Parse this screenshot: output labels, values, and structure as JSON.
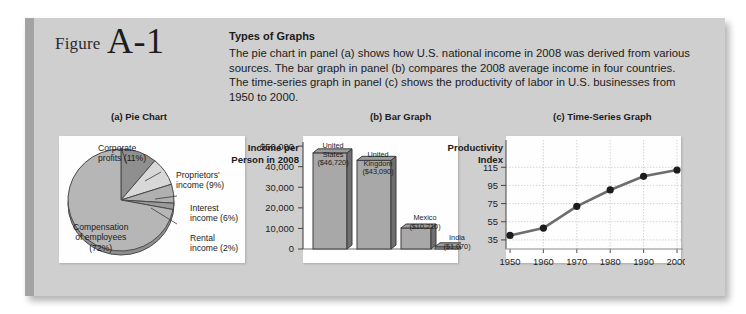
{
  "figure": {
    "label": "Figure",
    "number": "A-1"
  },
  "header": {
    "title": "Types of Graphs",
    "body": "The pie chart in panel (a) shows how U.S. national income in 2008 was derived from various sources. The bar graph in panel (b) compares the 2008 average income in four countries. The time-series graph in panel (c) shows the productivity of labor in U.S. businesses from 1950 to 2000."
  },
  "panels": {
    "a": {
      "caption": "(a) Pie Chart"
    },
    "b": {
      "caption": "(b) Bar Graph"
    },
    "c": {
      "caption": "(c) Time-Series Graph"
    }
  },
  "chart_data": [
    {
      "type": "pie",
      "title": "(a) Pie Chart",
      "labels": [
        "Compensation of employees (72%)",
        "Corporate profits (11%)",
        "Proprietors' income (9%)",
        "Interest income (6%)",
        "Rental income (2%)"
      ],
      "categories": [
        "Compensation of employees",
        "Corporate profits",
        "Proprietors' income",
        "Interest income",
        "Rental income"
      ],
      "values": [
        72,
        11,
        9,
        6,
        2
      ],
      "unit": "percent",
      "label_lines": {
        "corporate": [
          "Corporate",
          "profits (11%)"
        ],
        "proprietors": [
          "Proprietors'",
          "income (9%)"
        ],
        "interest": [
          "Interest",
          "income (6%)"
        ],
        "rental": [
          "Rental",
          "income (2%)"
        ],
        "compensation": [
          "Compensation",
          "of employees",
          "(72%)"
        ]
      },
      "colors": {
        "compensation": "#b6b6b6",
        "corporate": "#8f8f8f",
        "proprietors": "#d8d8d8",
        "interest": "#b0b0b0",
        "rental": "#9a9a9a",
        "outline": "#4a4a4a"
      },
      "legend": "none",
      "grid": false
    },
    {
      "type": "bar",
      "title": "(b) Bar Graph",
      "ylabel": "Income per Person in 2008",
      "ylabel_lines": [
        "Income per",
        "Person in 2008"
      ],
      "xlabel": "",
      "categories": [
        "United States",
        "United Kingdom",
        "Mexico",
        "India"
      ],
      "category_lines": [
        [
          "United",
          "States",
          "($46,720)"
        ],
        [
          "United",
          "Kingdom",
          "($43,090)"
        ],
        [
          "Mexico",
          "($10,210)"
        ],
        [
          "India",
          "($1,070)"
        ]
      ],
      "values": [
        46720,
        43090,
        10210,
        1070
      ],
      "value_labels": [
        "$46,720",
        "$43,090",
        "$10,210",
        "$1,070"
      ],
      "ylim": [
        0,
        52000
      ],
      "yticks": [
        0,
        10000,
        20000,
        30000,
        40000,
        50000
      ],
      "ytick_labels": [
        "0",
        "10,000",
        "20,000",
        "30,000",
        "40,000",
        "$50,000"
      ],
      "grid": false,
      "legend": "none",
      "colors": {
        "bar": "#a8a8a8",
        "bar_side": "#6f6f6f",
        "outline": "#3c3c3c"
      }
    },
    {
      "type": "line",
      "title": "(c) Time-Series Graph",
      "ylabel": "Productivity Index",
      "ylabel_lines": [
        "Productivity",
        "Index"
      ],
      "xlabel": "",
      "x": [
        1950,
        1960,
        1970,
        1980,
        1990,
        2000
      ],
      "xtick_labels": [
        "1950",
        "1960",
        "1970",
        "1980",
        "1990",
        "2000"
      ],
      "values": [
        40,
        48,
        72,
        90,
        105,
        112
      ],
      "ylim": [
        25,
        145
      ],
      "yticks": [
        35,
        55,
        75,
        95,
        115
      ],
      "ytick_labels": [
        "35",
        "55",
        "75",
        "95",
        "115"
      ],
      "grid": true,
      "legend": "none",
      "colors": {
        "line": "#6d6d6d",
        "marker": "#1c1c1c",
        "grid": "#c9c9c9"
      }
    }
  ]
}
